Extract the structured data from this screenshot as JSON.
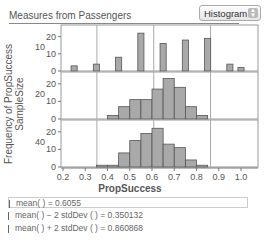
{
  "header": {
    "title": "Measures from Passengers",
    "display_type": "Histogram"
  },
  "axes": {
    "y_label_line1": "Frequency of PropSuccess",
    "y_label_line2": "SampleSize",
    "x_label": "PropSuccess",
    "x_ticks": [
      "0.2",
      "0.3",
      "0.4",
      "0.5",
      "0.6",
      "0.7",
      "0.8",
      "0.9",
      "1.0"
    ]
  },
  "stats": [
    {
      "label": "mean(  ) = 0.6055",
      "dim": false
    },
    {
      "label": "mean(  ) − 2 stdDev (  ) = 0.350132",
      "dim": true
    },
    {
      "label": "mean(  ) + 2 stdDev (  ) = 0.860868",
      "dim": true
    }
  ],
  "chart_data": {
    "type": "bar",
    "title": "Measures from Passengers",
    "xlabel": "PropSuccess",
    "ylabel": "Frequency of PropSuccess",
    "group_label": "SampleSize",
    "xlim": [
      0.2,
      1.05
    ],
    "grid": false,
    "reference_lines": {
      "mean": 0.6055,
      "mean_minus_2sd": 0.350132,
      "mean_plus_2sd": 0.860868
    },
    "panels": [
      {
        "sample_size": 10,
        "ylim": [
          0,
          25
        ],
        "y_ticks": [
          0,
          10,
          20
        ],
        "bins": [
          0.25,
          0.35,
          0.45,
          0.55,
          0.65,
          0.75,
          0.85,
          0.95,
          1.0
        ],
        "bin_width": 0.05,
        "values": [
          3,
          4,
          8,
          22,
          16,
          18,
          19,
          4,
          2
        ]
      },
      {
        "sample_size": 20,
        "ylim": [
          0,
          25
        ],
        "y_ticks": [
          0,
          10,
          20
        ],
        "bins": [
          0.425,
          0.475,
          0.525,
          0.575,
          0.625,
          0.675,
          0.725,
          0.775,
          0.825
        ],
        "bin_width": 0.05,
        "values": [
          2,
          7,
          11,
          11,
          17,
          23,
          18,
          7,
          2
        ]
      },
      {
        "sample_size": 40,
        "ylim": [
          0,
          25
        ],
        "y_ticks": [
          0,
          10,
          20
        ],
        "bins": [
          0.375,
          0.425,
          0.475,
          0.525,
          0.575,
          0.625,
          0.675,
          0.725,
          0.775,
          0.825
        ],
        "bin_width": 0.05,
        "values": [
          1,
          1,
          8,
          15,
          19,
          22,
          13,
          11,
          4,
          1
        ]
      }
    ]
  }
}
